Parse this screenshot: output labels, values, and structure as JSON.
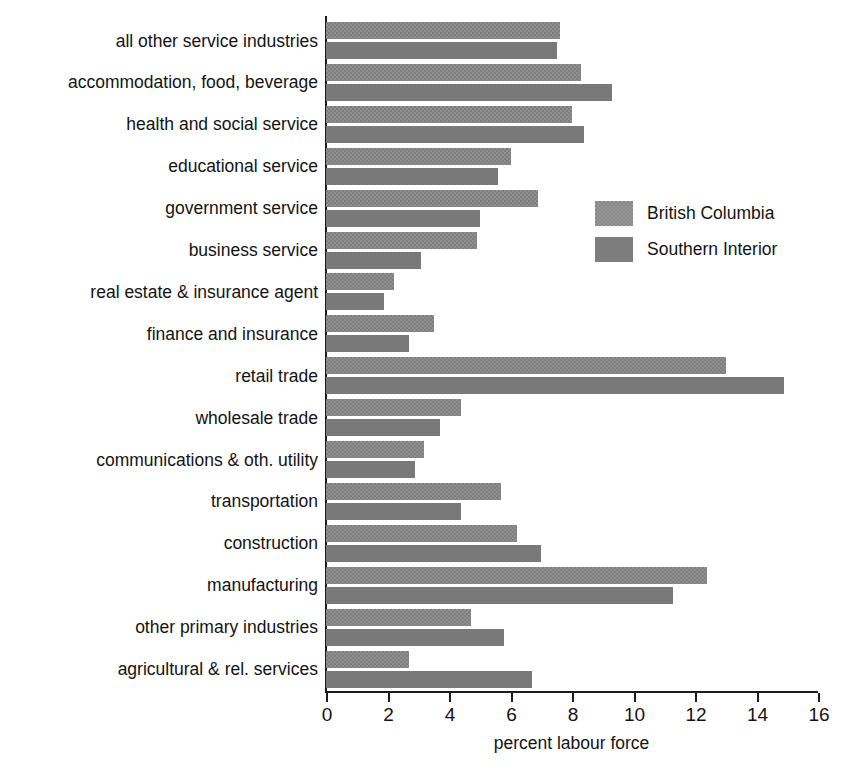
{
  "chart_data": {
    "type": "bar",
    "orientation": "horizontal",
    "title": "",
    "xlabel": "percent labour force",
    "ylabel": "",
    "xlim": [
      0,
      16
    ],
    "xticks": [
      0,
      2,
      4,
      6,
      8,
      10,
      12,
      14,
      16
    ],
    "xtick_labels": [
      "0",
      "2",
      "4",
      "6",
      "8",
      "10",
      "12",
      "14",
      "16"
    ],
    "grid": false,
    "legend_position": "upper right inside",
    "categories": [
      "all other service industries",
      "accommodation, food, beverage",
      "health and social service",
      "educational service",
      "government service",
      "business service",
      "real estate & insurance agent",
      "finance and insurance",
      "retail trade",
      "wholesale trade",
      "communications & oth. utility",
      "transportation",
      "construction",
      "manufacturing",
      "other primary industries",
      "agricultural & rel. services"
    ],
    "series": [
      {
        "name": "British Columbia",
        "color": "#7e7e7e",
        "values": [
          7.6,
          8.3,
          8.0,
          6.0,
          6.9,
          4.9,
          2.2,
          3.5,
          13.0,
          4.4,
          3.2,
          5.7,
          6.2,
          12.4,
          4.7,
          2.7
        ]
      },
      {
        "name": "Southern Interior",
        "color": "#797979",
        "values": [
          7.5,
          9.3,
          8.4,
          5.6,
          5.0,
          3.1,
          1.9,
          2.7,
          14.9,
          3.7,
          2.9,
          4.4,
          7.0,
          11.3,
          5.8,
          6.7
        ]
      }
    ]
  },
  "legend": {
    "items": [
      {
        "label": "British Columbia"
      },
      {
        "label": "Southern Interior"
      }
    ]
  },
  "axis": {
    "x_title": "percent labour force"
  }
}
